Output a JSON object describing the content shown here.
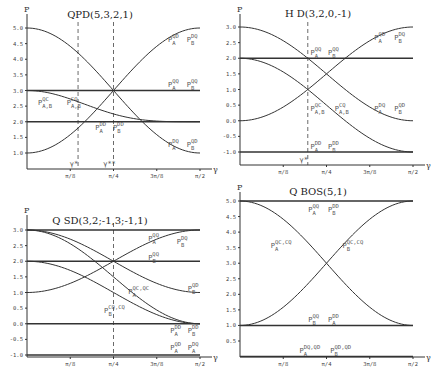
{
  "chart_data": [
    {
      "type": "line",
      "title": "QPD(5,3,2,1)",
      "xlabel": "γ",
      "ylabel": "P",
      "xlim": [
        0,
        1.5708
      ],
      "ylim": [
        0.6,
        5.2
      ],
      "x_ticks": [
        "π/8",
        "π/4",
        "3π/8",
        "π/2"
      ],
      "y_ticks": [
        "1.0",
        "1.5",
        "2.0",
        "2.5",
        "3.0",
        "3.5",
        "4.0",
        "4.5",
        "5.0"
      ],
      "y_tick_values": [
        1.0,
        1.5,
        2.0,
        2.5,
        3.0,
        3.5,
        4.0,
        4.5,
        5.0
      ],
      "vlines": [
        {
          "x": 0.4636,
          "label": "γ*"
        },
        {
          "x": 0.7854,
          "label": "γ**"
        }
      ],
      "series": [
        {
          "name": "P_A^QD, P_B^DQ",
          "kind": "cos2",
          "from": 1,
          "to": 5
        },
        {
          "name": "P_A^DQ, P_B^QD",
          "kind": "cos2",
          "from": 5,
          "to": 1
        },
        {
          "name": "P_A^QQ, P_B^QQ",
          "kind": "const",
          "value": 3
        },
        {
          "name": "P_A^DD, P_B^DD",
          "kind": "const",
          "value": 2
        },
        {
          "name": "P_{A,B}^QC, P_{A,B}^CQ",
          "kind": "cos4",
          "from": 3,
          "to": 2
        }
      ],
      "labels": [
        {
          "base": "P",
          "sub": "A",
          "sup": "QD",
          "at": [
            1.28,
            4.55
          ]
        },
        {
          "base": "P",
          "sub": "B",
          "sup": "DQ",
          "at": [
            1.45,
            4.55
          ]
        },
        {
          "base": "P",
          "sub": "A",
          "sup": "QQ",
          "at": [
            1.28,
            3.1
          ]
        },
        {
          "base": "P",
          "sub": "B",
          "sup": "QQ",
          "at": [
            1.45,
            3.1
          ]
        },
        {
          "base": "P",
          "sub": "A,B",
          "sup": "QC",
          "at": [
            0.1,
            2.55
          ]
        },
        {
          "base": "P",
          "sub": "A,B",
          "sup": "CQ",
          "at": [
            0.36,
            2.55
          ]
        },
        {
          "base": "P",
          "sub": "A",
          "sup": "DD",
          "at": [
            0.62,
            1.75
          ]
        },
        {
          "base": "P",
          "sub": "B",
          "sup": "DD",
          "at": [
            0.78,
            1.75
          ]
        },
        {
          "base": "P",
          "sub": "A",
          "sup": "DQ",
          "at": [
            1.28,
            1.2
          ]
        },
        {
          "base": "P",
          "sub": "B",
          "sup": "QD",
          "at": [
            1.45,
            1.2
          ]
        }
      ]
    },
    {
      "type": "line",
      "title": "H D(3,2,0,-1)",
      "xlabel": "γ",
      "ylabel": "P",
      "xlim": [
        0,
        1.5708
      ],
      "ylim": [
        -1.4,
        3.2
      ],
      "x_ticks": [
        "π/8",
        "π/4",
        "3π/8",
        "π/2"
      ],
      "y_ticks": [
        "-1.0",
        "-0.5",
        "0.0",
        "0.5",
        "1.0",
        "1.5",
        "2.0",
        "2.5",
        "3.0"
      ],
      "y_tick_values": [
        -1.0,
        -0.5,
        0.0,
        0.5,
        1.0,
        1.5,
        2.0,
        2.5,
        3.0
      ],
      "vlines": [
        {
          "x": 0.6155,
          "label": "γ*"
        }
      ],
      "series": [
        {
          "name": "P_A^QD, P_B^DQ",
          "kind": "cos2",
          "from": 0,
          "to": 3
        },
        {
          "name": "P_A^DQ, P_B^QD",
          "kind": "cos2",
          "from": 3,
          "to": 0
        },
        {
          "name": "P_A^QQ, P_B^QQ",
          "kind": "const",
          "value": 2
        },
        {
          "name": "P_A^DD, P_B^DD",
          "kind": "const",
          "value": -1
        },
        {
          "name": "P_{A,B}^QC, P_{A,B}^CQ",
          "kind": "cos2",
          "from": 2,
          "to": -1
        }
      ],
      "labels": [
        {
          "base": "P",
          "sub": "A",
          "sup": "QD",
          "at": [
            1.22,
            2.6
          ]
        },
        {
          "base": "P",
          "sub": "B",
          "sup": "DQ",
          "at": [
            1.4,
            2.6
          ]
        },
        {
          "base": "P",
          "sub": "A",
          "sup": "QQ",
          "at": [
            0.64,
            2.1
          ]
        },
        {
          "base": "P",
          "sub": "B",
          "sup": "QQ",
          "at": [
            0.8,
            2.1
          ]
        },
        {
          "base": "P",
          "sub": "A,B",
          "sup": "QC",
          "at": [
            0.64,
            0.3
          ]
        },
        {
          "base": "P",
          "sub": "A,B",
          "sup": "CQ",
          "at": [
            0.86,
            0.3
          ]
        },
        {
          "base": "P",
          "sub": "A",
          "sup": "DQ",
          "at": [
            1.22,
            0.3
          ]
        },
        {
          "base": "P",
          "sub": "B",
          "sup": "QD",
          "at": [
            1.4,
            0.3
          ]
        },
        {
          "base": "P",
          "sub": "A",
          "sup": "DD",
          "at": [
            0.64,
            -0.9
          ]
        },
        {
          "base": "P",
          "sub": "B",
          "sup": "DD",
          "at": [
            0.8,
            -0.9
          ]
        }
      ]
    },
    {
      "type": "line",
      "title": "Q SD(3,2;-1,3;-1,1)",
      "xlabel": "γ",
      "ylabel": "P",
      "xlim": [
        0,
        1.5708
      ],
      "ylim": [
        -1.05,
        3.2
      ],
      "x_ticks": [
        "π/8",
        "π/4",
        "3π/8",
        "π/2"
      ],
      "y_ticks": [
        "-1.0",
        "-0.5",
        "0.0",
        "0.5",
        "1.0",
        "1.5",
        "2.0",
        "2.5",
        "3.0"
      ],
      "y_tick_values": [
        -1.0,
        -0.5,
        0.0,
        0.5,
        1.0,
        1.5,
        2.0,
        2.5,
        3.0
      ],
      "vlines": [
        {
          "x": 0.7854,
          "label": ""
        }
      ],
      "series": [
        {
          "name": "P_A^QQ",
          "kind": "cos2",
          "from": 1,
          "to": 3
        },
        {
          "name": "P_B^QQ",
          "kind": "const",
          "value": 2
        },
        {
          "name": "P_B^QD",
          "kind": "cos2",
          "from": 3,
          "to": 1
        },
        {
          "name": "P_A^QC,QC",
          "kind": "cos2",
          "from": 3,
          "to": 0
        },
        {
          "name": "P_B^CQ,CQ",
          "kind": "cos2",
          "from": 2,
          "to": 0
        },
        {
          "name": "P_A^DD, P_B^DD",
          "kind": "const",
          "value": 0
        },
        {
          "name": "P_A^QD, P_A^DQ",
          "kind": "const",
          "value": -1
        },
        {
          "name": "P_A^QD, P_A^DQ",
          "kind": "const",
          "value": 3
        }
      ],
      "labels": [
        {
          "base": "P",
          "sub": "A",
          "sup": "QQ",
          "at": [
            1.1,
            2.65
          ]
        },
        {
          "base": "P",
          "sub": "B",
          "sup": "DQ",
          "at": [
            1.36,
            2.55
          ]
        },
        {
          "base": "P",
          "sub": "B",
          "sup": "QQ",
          "at": [
            1.1,
            2.05
          ]
        },
        {
          "base": "P",
          "sub": "B",
          "sup": "QD",
          "at": [
            1.46,
            1.05
          ]
        },
        {
          "base": "P",
          "sub": "A",
          "sup": "QC,QC",
          "at": [
            0.92,
            0.95
          ]
        },
        {
          "base": "P",
          "sub": "B",
          "sup": "CQ,CQ",
          "at": [
            0.7,
            0.35
          ]
        },
        {
          "base": "P",
          "sub": "A",
          "sup": "DD",
          "at": [
            1.3,
            -0.3
          ]
        },
        {
          "base": "P",
          "sub": "B",
          "sup": "DD",
          "at": [
            1.46,
            -0.3
          ]
        },
        {
          "base": "P",
          "sub": "A",
          "sup": "QD",
          "at": [
            1.3,
            -0.85
          ]
        },
        {
          "base": "P",
          "sub": "A",
          "sup": "DQ",
          "at": [
            1.46,
            -0.85
          ]
        }
      ]
    },
    {
      "type": "line",
      "title": "Q BOS(5,1)",
      "xlabel": "γ",
      "ylabel": "P",
      "xlim": [
        0,
        1.5708
      ],
      "ylim": [
        0.0,
        5.1
      ],
      "x_ticks": [
        "π/8",
        "π/4",
        "3π/8",
        "π/2"
      ],
      "y_ticks": [
        "0.5",
        "1.0",
        "1.5",
        "2.0",
        "2.5",
        "3.0",
        "3.5",
        "4.0",
        "4.5",
        "5.0"
      ],
      "y_tick_values": [
        0.5,
        1.0,
        1.5,
        2.0,
        2.5,
        3.0,
        3.5,
        4.0,
        4.5,
        5.0
      ],
      "vlines": [],
      "series": [
        {
          "name": "P_A^QQ, P_B^DD",
          "kind": "const",
          "value": 5
        },
        {
          "name": "P_B^QQ, P_A^DD",
          "kind": "const",
          "value": 1
        },
        {
          "name": "P_A^QC,CQ",
          "kind": "cos2",
          "from": 5,
          "to": 1
        },
        {
          "name": "P_B^QC,CQ",
          "kind": "cos2",
          "from": 1,
          "to": 5
        },
        {
          "name": "P_A^DQ,QD, P_B^QD,QD",
          "kind": "const",
          "value": 0
        }
      ],
      "labels": [
        {
          "base": "P",
          "sub": "A",
          "sup": "QQ",
          "at": [
            0.62,
            4.65
          ]
        },
        {
          "base": "P",
          "sub": "B",
          "sup": "DD",
          "at": [
            0.8,
            4.65
          ]
        },
        {
          "base": "P",
          "sub": "A",
          "sup": "QC,CQ",
          "at": [
            0.28,
            3.5
          ]
        },
        {
          "base": "P",
          "sub": "B",
          "sup": "QC,CQ",
          "at": [
            0.93,
            3.5
          ]
        },
        {
          "base": "P",
          "sub": "B",
          "sup": "QQ",
          "at": [
            0.62,
            1.1
          ]
        },
        {
          "base": "P",
          "sub": "A",
          "sup": "DD",
          "at": [
            0.8,
            1.1
          ]
        },
        {
          "base": "P",
          "sub": "A",
          "sup": "DQ,QD",
          "at": [
            0.54,
            0.1
          ]
        },
        {
          "base": "P",
          "sub": "B",
          "sup": "QD,QD",
          "at": [
            0.82,
            0.1
          ]
        }
      ]
    }
  ]
}
